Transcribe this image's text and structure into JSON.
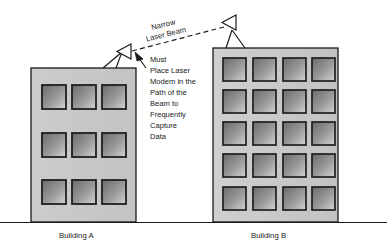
{
  "diagram": {
    "title_visible": false,
    "beam_label": {
      "line1": "Narrow",
      "line2": "Laser Beam"
    },
    "note": {
      "lines": [
        "Must",
        "Place Laser",
        "Modem in the",
        "Path of the",
        "Beam to",
        "Frequently",
        "Capture",
        "Data"
      ]
    },
    "buildings": [
      {
        "id": "a",
        "label": "Building A",
        "window_rows": 3,
        "window_cols": 3,
        "x": 31,
        "y": 68,
        "width": 105,
        "height": 154
      },
      {
        "id": "b",
        "label": "Building B",
        "window_rows": 5,
        "window_cols": 4,
        "x": 213,
        "y": 48,
        "width": 125,
        "height": 174
      }
    ],
    "devices": [
      {
        "id": "laser-a",
        "name": "laser-modem-building-a"
      },
      {
        "id": "laser-b",
        "name": "laser-modem-building-b"
      }
    ],
    "colors": {
      "wall": "#c9c9c9",
      "wall_edge": "#1a1a1a",
      "window_dark": "#6e6e6e",
      "window_light": "#d2d2d2",
      "window_border": "#1f1f1f",
      "ground": "#1a1a1a",
      "beam": "#1a1a1a",
      "text": "#1a1a1a"
    },
    "ground": {
      "y": 222
    }
  }
}
